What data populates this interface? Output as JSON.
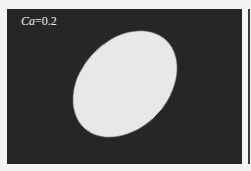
{
  "figure": {
    "label_symbol": "Ca",
    "label_value": "=0.2",
    "panel_color": "#262626",
    "droplet_color": "#e8e8e8",
    "background_color": "#f4f4f4"
  }
}
